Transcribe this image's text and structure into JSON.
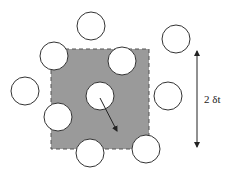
{
  "diagram": {
    "region": {
      "x": 51,
      "y": 49,
      "width": 98,
      "height": 100,
      "fill": "#9a9a9a",
      "border": "dashed"
    },
    "particle_radius": 14,
    "particles": [
      {
        "id": "top",
        "cx": 91,
        "cy": 26
      },
      {
        "id": "top-right",
        "cx": 176,
        "cy": 39
      },
      {
        "id": "upper-left",
        "cx": 54,
        "cy": 56
      },
      {
        "id": "upper-middle",
        "cx": 122,
        "cy": 61
      },
      {
        "id": "left",
        "cx": 25,
        "cy": 91
      },
      {
        "id": "center",
        "cx": 100,
        "cy": 96
      },
      {
        "id": "right",
        "cx": 168,
        "cy": 96
      },
      {
        "id": "lower-left",
        "cx": 58,
        "cy": 117
      },
      {
        "id": "bottom",
        "cx": 90,
        "cy": 153
      },
      {
        "id": "bottom-right",
        "cx": 146,
        "cy": 149
      }
    ],
    "displacement_arrow": {
      "x1": 100,
      "y1": 98,
      "x2": 117,
      "y2": 131
    },
    "dimension": {
      "x": 197,
      "y1": 49,
      "y2": 149,
      "label": "2 δt"
    }
  }
}
